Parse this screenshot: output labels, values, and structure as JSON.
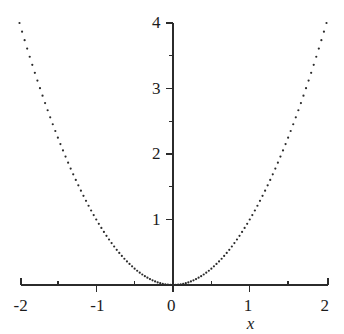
{
  "chart_data": {
    "type": "scatter",
    "title": "",
    "subtitle": "",
    "xlabel": "x",
    "ylabel": "",
    "xlim": [
      -2,
      2
    ],
    "ylim": [
      0,
      4
    ],
    "grid": false,
    "legend": null,
    "marker": {
      "style": "point",
      "color": "#2b2b2b",
      "size_px": 2.2
    },
    "axis_color": "#2b2b2b",
    "background": "#ffffff",
    "function": "y = x^2",
    "sample_count": 121,
    "x_ticks_major": [
      -2,
      -1,
      0,
      1,
      2
    ],
    "x_tick_labels": [
      "-2",
      "-1",
      "0",
      "1",
      "2"
    ],
    "x_ticks_minor": [
      -1.5,
      -0.5,
      0.5,
      1.5
    ],
    "y_ticks_major": [
      1,
      2,
      3,
      4
    ],
    "y_tick_labels": [
      "1",
      "2",
      "3",
      "4"
    ],
    "y_ticks_minor": [
      0.5,
      1.5,
      2.5,
      3.5
    ],
    "x": [
      -2,
      -1.9666666667,
      -1.9333333333,
      -1.9,
      -1.8666666667,
      -1.8333333333,
      -1.8,
      -1.7666666667,
      -1.7333333333,
      -1.7,
      -1.6666666667,
      -1.6333333333,
      -1.6,
      -1.5666666667,
      -1.5333333333,
      -1.5,
      -1.4666666667,
      -1.4333333333,
      -1.4,
      -1.3666666667,
      -1.3333333333,
      -1.3,
      -1.2666666667,
      -1.2333333333,
      -1.2,
      -1.1666666667,
      -1.1333333333,
      -1.1,
      -1.0666666667,
      -1.0333333333,
      -1,
      -0.9666666667,
      -0.9333333333,
      -0.9,
      -0.8666666667,
      -0.8333333333,
      -0.8,
      -0.7666666667,
      -0.7333333333,
      -0.7,
      -0.6666666667,
      -0.6333333333,
      -0.6,
      -0.5666666667,
      -0.5333333333,
      -0.5,
      -0.4666666667,
      -0.4333333333,
      -0.4,
      -0.3666666667,
      -0.3333333333,
      -0.3,
      -0.2666666667,
      -0.2333333333,
      -0.2,
      -0.1666666667,
      -0.1333333333,
      -0.1,
      -0.0666666667,
      -0.0333333333,
      0,
      0.0333333333,
      0.0666666667,
      0.1,
      0.1333333333,
      0.1666666667,
      0.2,
      0.2333333333,
      0.2666666667,
      0.3,
      0.3333333333,
      0.3666666667,
      0.4,
      0.4333333333,
      0.4666666667,
      0.5,
      0.5333333333,
      0.5666666667,
      0.6,
      0.6333333333,
      0.6666666667,
      0.7,
      0.7333333333,
      0.7666666667,
      0.8,
      0.8333333333,
      0.8666666667,
      0.9,
      0.9333333333,
      0.9666666667,
      1,
      1.0333333333,
      1.0666666667,
      1.1,
      1.1333333333,
      1.1666666667,
      1.2,
      1.2333333333,
      1.2666666667,
      1.3,
      1.3333333333,
      1.3666666667,
      1.4,
      1.4333333333,
      1.4666666667,
      1.5,
      1.5333333333,
      1.5666666667,
      1.6,
      1.6333333333,
      1.6666666667,
      1.7,
      1.7333333333,
      1.7666666667,
      1.8,
      1.8333333333,
      1.8666666667,
      1.9,
      1.9333333333,
      1.9666666667,
      2
    ],
    "y": [
      4,
      3.8677777778,
      3.7377777778,
      3.61,
      3.4844444444,
      3.3611111111,
      3.24,
      3.1211111111,
      3.0044444444,
      2.89,
      2.7777777778,
      2.6677777778,
      2.56,
      2.4544444444,
      2.3511111111,
      2.25,
      2.1511111111,
      2.0544444444,
      1.96,
      1.8677777778,
      1.7777777778,
      1.69,
      1.6044444444,
      1.5211111111,
      1.44,
      1.3611111111,
      1.2844444444,
      1.21,
      1.1377777778,
      1.0677777778,
      1,
      0.9344444444,
      0.8711111111,
      0.81,
      0.7511111111,
      0.6944444444,
      0.64,
      0.5877777778,
      0.5377777778,
      0.49,
      0.4444444444,
      0.4011111111,
      0.36,
      0.3211111111,
      0.2844444444,
      0.25,
      0.2177777778,
      0.1877777778,
      0.16,
      0.1344444444,
      0.1111111111,
      0.09,
      0.0711111111,
      0.0544444444,
      0.04,
      0.0277777778,
      0.0177777778,
      0.01,
      0.0044444444,
      0.0011111111,
      0,
      0.0011111111,
      0.0044444444,
      0.01,
      0.0177777778,
      0.0277777778,
      0.04,
      0.0544444444,
      0.0711111111,
      0.09,
      0.1111111111,
      0.1344444444,
      0.16,
      0.1877777778,
      0.2177777778,
      0.25,
      0.2844444444,
      0.3211111111,
      0.36,
      0.4011111111,
      0.4444444444,
      0.49,
      0.5377777778,
      0.5877777778,
      0.64,
      0.6944444444,
      0.7511111111,
      0.81,
      0.8711111111,
      0.9344444444,
      1,
      1.0677777778,
      1.1377777778,
      1.21,
      1.2844444444,
      1.3611111111,
      1.44,
      1.5211111111,
      1.6044444444,
      1.69,
      1.7777777778,
      1.8677777778,
      1.96,
      2.0544444444,
      2.1511111111,
      2.25,
      2.3511111111,
      2.4544444444,
      2.56,
      2.6677777778,
      2.7777777778,
      2.89,
      3.0044444444,
      3.1211111111,
      3.24,
      3.3611111111,
      3.4844444444,
      3.61,
      3.7377777778,
      3.8677777778,
      4
    ]
  },
  "geometry": {
    "x_axis_y_px": 285,
    "y_axis_x_px": 173,
    "x_left_px": 21,
    "x_right_px": 328,
    "y_top_px": 23,
    "px_per_x_unit": 76.75,
    "px_per_y_unit": 65.5,
    "major_tick_len": 7,
    "minor_tick_len": 4
  }
}
